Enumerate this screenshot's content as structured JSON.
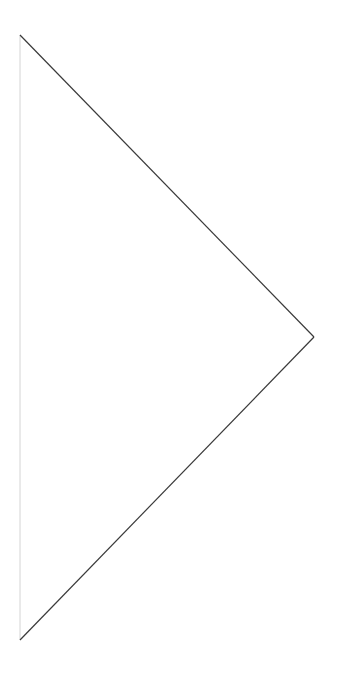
{
  "shape": {
    "icon": "play-triangle-outline-icon",
    "points": {
      "top": [
        20,
        35
      ],
      "tip": [
        314,
        337
      ],
      "bottom": [
        20,
        640
      ]
    },
    "colors": {
      "diagonal_stroke": "#3a3a3a",
      "left_edge_stroke": "#d4d4d4",
      "background": "#ffffff"
    }
  }
}
